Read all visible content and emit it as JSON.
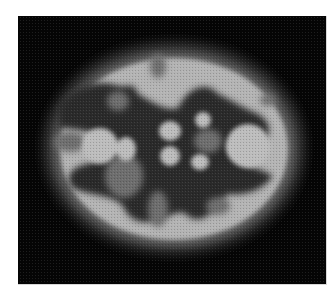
{
  "image": {
    "subject": "axial brain scan (grayscale PET/SPECT-style)",
    "background_color": "#ffffff",
    "frame_color": "#050505",
    "frame": {
      "x": 18,
      "y": 16,
      "width": 308,
      "height": 268
    },
    "palette": {
      "halo": "#3a3a3a",
      "outer_ring": "#5a5a5a",
      "cortex": "#b4b4b4",
      "cortex_bright": "#c8c8c8",
      "white_matter": "#2a2a2a",
      "mid_gray": "#6e6e6e",
      "deep_bright": "#bdbdbd"
    },
    "layers": {
      "halo": {
        "cx": 156,
        "cy": 132,
        "rx": 130,
        "ry": 105
      },
      "outer_ring": {
        "cx": 156,
        "cy": 133,
        "rx": 121,
        "ry": 97
      },
      "cortex": {
        "cx": 156,
        "cy": 133,
        "rx": 114,
        "ry": 91
      },
      "dark_regions": [
        {
          "d": "M40,90 C55,70 80,62 100,70 C110,72 115,65 120,78 C140,90 150,95 160,92 C170,70 190,65 200,78 C215,85 225,92 240,98 C252,106 255,115 245,125 C235,120 220,118 210,130 C215,150 240,150 255,160 C245,175 225,180 210,178 C195,195 185,210 170,200 C160,190 150,205 140,200 C130,212 110,205 105,190 C95,178 70,180 55,172 C45,160 55,150 70,148 C85,142 90,128 80,120 C70,112 50,115 40,110 Z"
        }
      ],
      "bright_blobs": [
        {
          "cx": 108,
          "cy": 133,
          "rx": 10,
          "ry": 12
        },
        {
          "cx": 152,
          "cy": 115,
          "rx": 11,
          "ry": 10
        },
        {
          "cx": 152,
          "cy": 140,
          "rx": 10,
          "ry": 10
        },
        {
          "cx": 185,
          "cy": 104,
          "rx": 8,
          "ry": 8
        },
        {
          "cx": 182,
          "cy": 146,
          "rx": 9,
          "ry": 8
        },
        {
          "cx": 82,
          "cy": 130,
          "rx": 18,
          "ry": 18
        },
        {
          "cx": 230,
          "cy": 130,
          "rx": 22,
          "ry": 22
        }
      ],
      "gray_patches": [
        {
          "cx": 52,
          "cy": 126,
          "rx": 16,
          "ry": 10
        },
        {
          "cx": 106,
          "cy": 160,
          "rx": 19,
          "ry": 22
        },
        {
          "cx": 190,
          "cy": 125,
          "rx": 14,
          "ry": 12
        },
        {
          "cx": 140,
          "cy": 193,
          "rx": 10,
          "ry": 18
        },
        {
          "cx": 200,
          "cy": 190,
          "rx": 12,
          "ry": 9
        },
        {
          "cx": 140,
          "cy": 50,
          "rx": 8,
          "ry": 12
        },
        {
          "cx": 100,
          "cy": 85,
          "rx": 11,
          "ry": 10
        },
        {
          "cx": 250,
          "cy": 84,
          "rx": 8,
          "ry": 6
        }
      ]
    }
  }
}
